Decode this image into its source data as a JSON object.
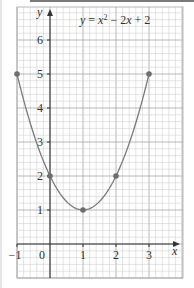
{
  "chart_data": {
    "type": "line",
    "title_parts": {
      "y": "y",
      "eq": " = ",
      "x": "x",
      "sup": "2",
      "rest": " − 2",
      "x2": "x",
      "tail": " + 2"
    },
    "xlabel": "x",
    "ylabel": "y",
    "xlim": [
      -1,
      3.9
    ],
    "ylim": [
      -1,
      6.9
    ],
    "x_ticks": [
      -1,
      0,
      1,
      2,
      3
    ],
    "x_tick_labels": [
      "−1",
      "0",
      "1",
      "2",
      "3"
    ],
    "y_ticks": [
      1,
      2,
      3,
      4,
      5,
      6
    ],
    "y_tick_labels": [
      "1",
      "2",
      "3",
      "4",
      "5",
      "6"
    ],
    "grid": true,
    "minor_grid_per_unit": 5,
    "points": [
      {
        "x": -1,
        "y": 5
      },
      {
        "x": 0,
        "y": 2
      },
      {
        "x": 1,
        "y": 1
      },
      {
        "x": 2,
        "y": 2
      },
      {
        "x": 3,
        "y": 5
      }
    ],
    "series": [
      {
        "name": "y = x^2 - 2x + 2",
        "x": [
          -1,
          0,
          1,
          2,
          3
        ],
        "values": [
          5,
          2,
          1,
          2,
          5
        ]
      }
    ],
    "colors": {
      "curve": "#7a7a7a",
      "point": "#6e6e6e",
      "grid_minor": "#c8c8c8",
      "grid_major": "#a6a6a6",
      "axis": "#333333"
    }
  }
}
